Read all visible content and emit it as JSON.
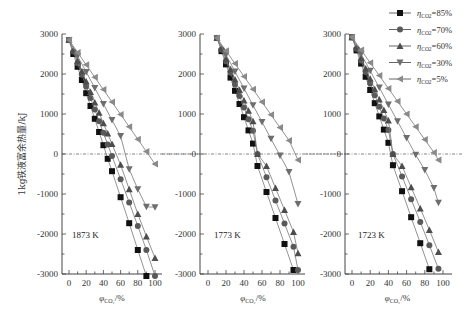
{
  "chart_data": [
    {
      "type": "line",
      "panel_label": "1873 K",
      "xlabel": "φCO2/%",
      "ylabel": "1kg铁液富余热量/kJ",
      "xticks": [
        0,
        20,
        40,
        60,
        80,
        100
      ],
      "yticks": [
        3000,
        2000,
        1000,
        0,
        -1000,
        -2000,
        -3000
      ],
      "ylim": [
        -3000,
        3000
      ],
      "xlim": [
        -5,
        105
      ],
      "zero_line": true,
      "series": [
        {
          "name": "ηCO2=85%",
          "marker": "square",
          "x": [
            0,
            5,
            10,
            15,
            20,
            25,
            30,
            35,
            40,
            45,
            50,
            60,
            70,
            80,
            90
          ],
          "values": [
            2850,
            2500,
            2180,
            1850,
            1520,
            1200,
            880,
            550,
            220,
            -120,
            -430,
            -1080,
            -1730,
            -2400,
            -3050
          ]
        },
        {
          "name": "ηCO2=70%",
          "marker": "circle",
          "x": [
            0,
            5,
            10,
            15,
            20,
            25,
            30,
            35,
            40,
            45,
            50,
            60,
            70,
            80,
            90,
            100
          ],
          "values": [
            2850,
            2560,
            2270,
            1980,
            1690,
            1400,
            1110,
            820,
            530,
            240,
            -50,
            -630,
            -1210,
            -1800,
            -2400,
            -3050
          ]
        },
        {
          "name": "ηCO2=60%",
          "marker": "triangle-up",
          "x": [
            0,
            5,
            10,
            15,
            20,
            25,
            30,
            35,
            40,
            45,
            50,
            60,
            70,
            80,
            90,
            100
          ],
          "values": [
            2850,
            2590,
            2330,
            2070,
            1810,
            1550,
            1290,
            1030,
            770,
            510,
            250,
            -270,
            -880,
            -1500,
            -2060,
            -2600
          ]
        },
        {
          "name": "ηCO2=30%",
          "marker": "triangle-down",
          "x": [
            0,
            10,
            20,
            30,
            40,
            50,
            60,
            70,
            80,
            90,
            100
          ],
          "values": [
            2850,
            2450,
            2050,
            1650,
            1250,
            850,
            450,
            -380,
            -880,
            -1320,
            -1330
          ]
        },
        {
          "name": "ηCO2=5%",
          "marker": "triangle-left",
          "x": [
            0,
            10,
            20,
            30,
            40,
            50,
            60,
            70,
            80,
            90,
            100
          ],
          "values": [
            2850,
            2540,
            2230,
            1920,
            1610,
            1300,
            990,
            680,
            370,
            60,
            -250
          ]
        }
      ]
    },
    {
      "type": "line",
      "panel_label": "1773 K",
      "xlabel": "φCO2/%",
      "ylabel": "",
      "xticks": [
        0,
        20,
        40,
        60,
        80,
        100
      ],
      "yticks": [
        3000,
        2000,
        1000,
        0,
        -1000,
        -2000,
        -3000
      ],
      "ylim": [
        -3000,
        3000
      ],
      "xlim": [
        -5,
        105
      ],
      "zero_line": true,
      "series": [
        {
          "name": "ηCO2=85%",
          "marker": "square",
          "x": [
            10,
            15,
            20,
            25,
            30,
            35,
            40,
            45,
            50,
            55,
            65,
            75,
            85,
            95
          ],
          "values": [
            2900,
            2570,
            2240,
            1910,
            1580,
            1250,
            920,
            590,
            260,
            -300,
            -950,
            -1600,
            -2250,
            -2900
          ]
        },
        {
          "name": "ηCO2=70%",
          "marker": "circle",
          "x": [
            10,
            15,
            20,
            25,
            30,
            35,
            40,
            45,
            50,
            55,
            65,
            75,
            85,
            95,
            100
          ],
          "values": [
            2900,
            2610,
            2320,
            2030,
            1740,
            1450,
            1160,
            870,
            580,
            0,
            -580,
            -1160,
            -1740,
            -2320,
            -2900
          ]
        },
        {
          "name": "ηCO2=60%",
          "marker": "triangle-up",
          "x": [
            10,
            15,
            20,
            25,
            30,
            35,
            40,
            45,
            50,
            55,
            65,
            75,
            85,
            95,
            100
          ],
          "values": [
            2900,
            2640,
            2380,
            2120,
            1860,
            1600,
            1340,
            1080,
            820,
            0,
            -300,
            -850,
            -1400,
            -1950,
            -2480
          ]
        },
        {
          "name": "ηCO2=30%",
          "marker": "triangle-down",
          "x": [
            10,
            20,
            30,
            40,
            50,
            60,
            70,
            80,
            90,
            100
          ],
          "values": [
            2900,
            2480,
            2060,
            1640,
            1220,
            800,
            380,
            -40,
            -450,
            -1250
          ]
        },
        {
          "name": "ηCO2=5%",
          "marker": "triangle-left",
          "x": [
            10,
            20,
            30,
            40,
            50,
            60,
            70,
            80,
            90,
            100
          ],
          "values": [
            2900,
            2580,
            2260,
            1940,
            1620,
            1300,
            980,
            660,
            340,
            -150
          ]
        }
      ]
    },
    {
      "type": "line",
      "panel_label": "1723 K",
      "xlabel": "φCO2/%",
      "ylabel": "",
      "xticks": [
        0,
        20,
        40,
        60,
        80,
        100
      ],
      "yticks": [
        3000,
        2000,
        1000,
        0,
        -1000,
        -2000,
        -3000
      ],
      "ylim": [
        -3000,
        3000
      ],
      "xlim": [
        -5,
        105
      ],
      "zero_line": true,
      "series": [
        {
          "name": "ηCO2=85%",
          "marker": "square",
          "x": [
            0,
            5,
            10,
            15,
            20,
            25,
            30,
            35,
            40,
            45,
            55,
            65,
            75,
            85
          ],
          "values": [
            2920,
            2590,
            2260,
            1930,
            1600,
            1270,
            940,
            610,
            280,
            -280,
            -930,
            -1580,
            -2230,
            -2880
          ]
        },
        {
          "name": "ηCO2=70%",
          "marker": "circle",
          "x": [
            0,
            5,
            10,
            15,
            20,
            25,
            30,
            35,
            40,
            45,
            55,
            65,
            75,
            85,
            95
          ],
          "values": [
            2920,
            2630,
            2340,
            2050,
            1760,
            1470,
            1180,
            890,
            600,
            0,
            -560,
            -1130,
            -1700,
            -2280,
            -2870
          ]
        },
        {
          "name": "ηCO2=60%",
          "marker": "triangle-up",
          "x": [
            0,
            5,
            10,
            15,
            20,
            25,
            30,
            35,
            40,
            45,
            55,
            65,
            75,
            85,
            95
          ],
          "values": [
            2920,
            2660,
            2400,
            2140,
            1880,
            1620,
            1360,
            1100,
            840,
            0,
            -300,
            -830,
            -1360,
            -1900,
            -2450
          ]
        },
        {
          "name": "ηCO2=30%",
          "marker": "triangle-down",
          "x": [
            0,
            10,
            20,
            30,
            40,
            50,
            60,
            70,
            80,
            90,
            95
          ],
          "values": [
            2920,
            2500,
            2080,
            1660,
            1240,
            820,
            400,
            -20,
            -400,
            -850,
            -1220
          ]
        },
        {
          "name": "ηCO2=5%",
          "marker": "triangle-left",
          "x": [
            0,
            10,
            20,
            30,
            40,
            50,
            60,
            70,
            80,
            90,
            95
          ],
          "values": [
            2920,
            2600,
            2280,
            1960,
            1640,
            1320,
            1000,
            680,
            360,
            40,
            -150
          ]
        }
      ]
    }
  ],
  "legend": {
    "position": "top-right",
    "items": [
      {
        "label": "ηCO2=85%",
        "eta": "η",
        "sub": "CO2",
        "value": "=85%",
        "marker": "square"
      },
      {
        "label": "ηCO2=70%",
        "eta": "η",
        "sub": "CO2",
        "value": "=70%",
        "marker": "circle"
      },
      {
        "label": "ηCO2=60%",
        "eta": "η",
        "sub": "CO2",
        "value": "=60%",
        "marker": "triangle-up"
      },
      {
        "label": "ηCO2=30%",
        "eta": "η",
        "sub": "CO2",
        "value": "=30%",
        "marker": "triangle-down"
      },
      {
        "label": "ηCO2=5%",
        "eta": "η",
        "sub": "CO2",
        "value": "=5%",
        "marker": "triangle-left"
      }
    ]
  },
  "colors": {
    "square": "#111111",
    "circle": "#595959",
    "triangle-up": "#4d4d4d",
    "triangle-down": "#6e6e6e",
    "triangle-left": "#8a8a8a",
    "line": "#777777",
    "axis": "#444444"
  }
}
